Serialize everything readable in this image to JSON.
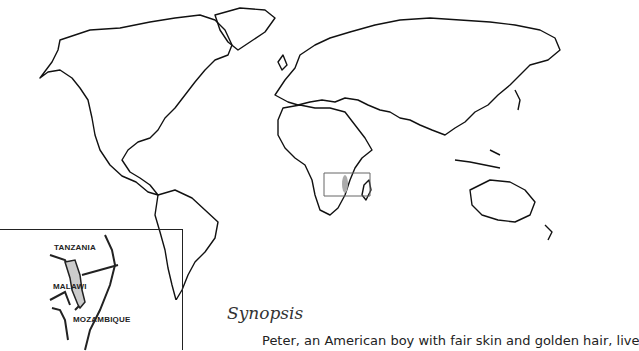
{
  "map": {
    "inset_labels": {
      "country_1": "TANZANIA",
      "country_2": "MALAWI",
      "country_3": "MOZAMBIQUE"
    }
  },
  "synopsis": {
    "title": "Synopsis",
    "text": "Peter, an American boy with fair skin and golden hair, live"
  }
}
